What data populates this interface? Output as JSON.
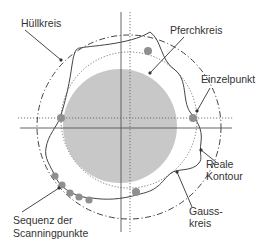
{
  "colors": {
    "disc_fill": "#c8c8c8",
    "point_fill": "#8f8f8f",
    "line": "#444444",
    "dotted": "#666666",
    "text": "#333333"
  },
  "labels": {
    "huellkreis": "Hüllkreis",
    "pferchkreis": "Pferchkreis",
    "einzelpunkt": "Einzelpunkt",
    "reale_kontour_1": "Reale",
    "reale_kontour_2": "Kontour",
    "gausskreis_1": "Gauss-",
    "gausskreis_2": "kreis",
    "sequenz_1": "Sequenz der",
    "sequenz_2": "Scanningpunkte"
  },
  "elements": [
    {
      "name": "huellkreis",
      "description": "circumscribed circle",
      "style": "dash-dot"
    },
    {
      "name": "pferchkreis",
      "description": "inscribed circle",
      "style": "filled gray disc"
    },
    {
      "name": "gausskreis",
      "description": "least-squares circle",
      "style": "dotted"
    },
    {
      "name": "reale-kontour",
      "description": "real contour",
      "style": "solid"
    },
    {
      "name": "einzelpunkt",
      "description": "single point",
      "style": "gray dot"
    },
    {
      "name": "scanning-sequence",
      "description": "sequence of scanning points",
      "count": 5
    }
  ]
}
